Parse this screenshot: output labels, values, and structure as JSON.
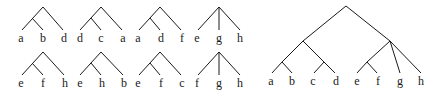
{
  "small_trees": [
    {
      "type": "binary-left",
      "leaves": [
        "a",
        "b",
        "d"
      ]
    },
    {
      "type": "binary-left",
      "leaves": [
        "d",
        "c",
        "a"
      ]
    },
    {
      "type": "binary-left",
      "leaves": [
        "a",
        "d",
        "f"
      ]
    },
    {
      "type": "star",
      "leaves": [
        "e",
        "g",
        "h"
      ]
    },
    {
      "type": "binary-left",
      "leaves": [
        "e",
        "f",
        "h"
      ]
    },
    {
      "type": "binary-left",
      "leaves": [
        "e",
        "h",
        "b"
      ]
    },
    {
      "type": "binary-left",
      "leaves": [
        "e",
        "f",
        "c"
      ]
    },
    {
      "type": "star",
      "leaves": [
        "f",
        "g",
        "h"
      ]
    }
  ],
  "large_tree": {
    "leaves": [
      "a",
      "b",
      "c",
      "d",
      "e",
      "f",
      "g",
      "h"
    ],
    "structure": "((a,b),(c,d)),((e,f),g,h)"
  }
}
